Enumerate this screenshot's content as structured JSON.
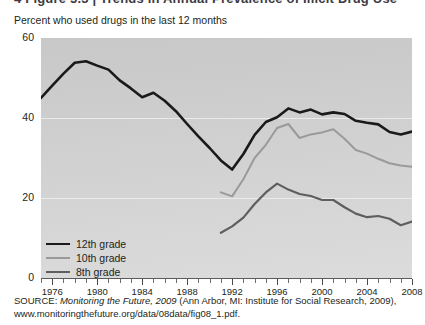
{
  "top_cutoff_text": "4 Figure 5.3 | Trends in Annual Prevalence of Illicit Drug Use",
  "subtitle": "Percent who used drugs in the last 12 months",
  "source": {
    "label": "SOURCE:",
    "italic_title": "Monitoring the Future, 2009",
    "rest": " (Ann Arbor, MI: Institute for Social Research, 2009),",
    "url": "www.monitoringthefuture.org/data/08data/fig08_1.pdf."
  },
  "legend": [
    {
      "label": "12th grade",
      "color": "#1a1a1a",
      "width": 2.6
    },
    {
      "label": "10th grade",
      "color": "#9a9a9a",
      "width": 2.0
    },
    {
      "label": "8th grade",
      "color": "#5e5e5e",
      "width": 2.2
    }
  ],
  "chart_data": {
    "type": "line",
    "title": "",
    "subtitle": "Percent who used drugs in the last 12 months",
    "xlabel": "",
    "ylabel": "",
    "xlim": [
      1975,
      2008
    ],
    "ylim": [
      0,
      60
    ],
    "yticks": [
      0,
      20,
      40,
      60
    ],
    "xticks_labeled": [
      1976,
      1980,
      1984,
      1988,
      1992,
      1996,
      2000,
      2004,
      2008
    ],
    "xtick_interval_years": 1,
    "grid": "horizontal",
    "legend_position": "inside-lower-left",
    "plot_background": "#d0d0d0",
    "series": [
      {
        "name": "12th grade",
        "color": "#1a1a1a",
        "x": [
          1975,
          1976,
          1977,
          1978,
          1979,
          1980,
          1981,
          1982,
          1983,
          1984,
          1985,
          1986,
          1987,
          1988,
          1989,
          1990,
          1991,
          1992,
          1993,
          1994,
          1995,
          1996,
          1997,
          1998,
          1999,
          2000,
          2001,
          2002,
          2003,
          2004,
          2005,
          2006,
          2007,
          2008
        ],
        "y": [
          45.0,
          48.1,
          51.1,
          53.8,
          54.2,
          53.1,
          52.1,
          49.4,
          47.4,
          45.2,
          46.3,
          44.3,
          41.7,
          38.5,
          35.4,
          32.5,
          29.4,
          27.1,
          31.0,
          35.8,
          39.0,
          40.2,
          42.4,
          41.4,
          42.1,
          40.9,
          41.4,
          41.0,
          39.3,
          38.8,
          38.4,
          36.5,
          35.9,
          36.6
        ]
      },
      {
        "name": "10th grade",
        "color": "#9a9a9a",
        "x": [
          1991,
          1992,
          1993,
          1994,
          1995,
          1996,
          1997,
          1998,
          1999,
          2000,
          2001,
          2002,
          2003,
          2004,
          2005,
          2006,
          2007,
          2008
        ],
        "y": [
          21.4,
          20.4,
          24.7,
          30.0,
          33.3,
          37.5,
          38.5,
          35.0,
          35.9,
          36.4,
          37.2,
          34.8,
          32.0,
          31.1,
          29.8,
          28.7,
          28.1,
          27.8
        ]
      },
      {
        "name": "8th grade",
        "color": "#5e5e5e",
        "x": [
          1991,
          1992,
          1993,
          1994,
          1995,
          1996,
          1997,
          1998,
          1999,
          2000,
          2001,
          2002,
          2003,
          2004,
          2005,
          2006,
          2007,
          2008
        ],
        "y": [
          11.3,
          12.9,
          15.1,
          18.5,
          21.4,
          23.6,
          22.1,
          21.0,
          20.5,
          19.5,
          19.5,
          17.7,
          16.1,
          15.2,
          15.5,
          14.8,
          13.2,
          14.1
        ]
      }
    ]
  }
}
